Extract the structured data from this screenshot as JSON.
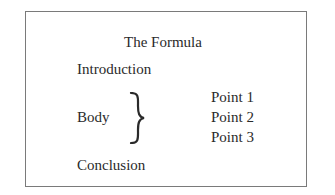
{
  "diagram": {
    "title": "The Formula",
    "sections": {
      "introduction": "Introduction",
      "body": "Body",
      "conclusion": "Conclusion"
    },
    "body_points": [
      "Point 1",
      "Point 2",
      "Point 3"
    ],
    "connector_icon": "right-curly-brace"
  }
}
